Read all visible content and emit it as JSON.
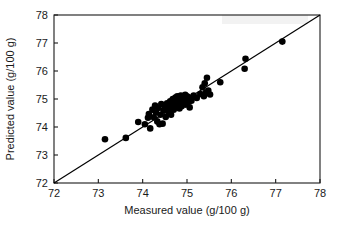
{
  "chart_data": {
    "type": "scatter",
    "title": "",
    "xlabel": "Measured value (g/100 g)",
    "ylabel": "Predicted value (g/100 g)",
    "xlim": [
      72,
      78
    ],
    "ylim": [
      72,
      78
    ],
    "xticks": [
      72,
      73,
      74,
      75,
      76,
      77,
      78
    ],
    "yticks": [
      72,
      73,
      74,
      75,
      76,
      77,
      78
    ],
    "xtick_labels": [
      "72",
      "73",
      "74",
      "75",
      "76",
      "77",
      "78"
    ],
    "ytick_labels": [
      "72",
      "73",
      "74",
      "75",
      "76",
      "77",
      "78"
    ],
    "grid": false,
    "legend": null,
    "marker_color": "#000000",
    "marker_size": 4.6,
    "reference_line": {
      "name": "identity-line",
      "type": "line",
      "from": [
        72,
        72
      ],
      "to": [
        78,
        78
      ],
      "color": "#000000"
    },
    "points": [
      [
        73.15,
        73.56
      ],
      [
        73.62,
        73.61
      ],
      [
        73.9,
        74.18
      ],
      [
        74.05,
        74.1
      ],
      [
        74.12,
        74.33
      ],
      [
        74.14,
        74.46
      ],
      [
        74.17,
        73.95
      ],
      [
        74.22,
        74.62
      ],
      [
        74.25,
        74.35
      ],
      [
        74.28,
        74.77
      ],
      [
        74.3,
        74.52
      ],
      [
        74.33,
        74.2
      ],
      [
        74.35,
        74.68
      ],
      [
        74.38,
        74.1
      ],
      [
        74.4,
        74.44
      ],
      [
        74.42,
        74.82
      ],
      [
        74.45,
        74.12
      ],
      [
        74.47,
        74.6
      ],
      [
        74.5,
        74.73
      ],
      [
        74.52,
        74.36
      ],
      [
        74.55,
        74.85
      ],
      [
        74.58,
        74.55
      ],
      [
        74.6,
        74.7
      ],
      [
        74.62,
        74.92
      ],
      [
        74.64,
        74.44
      ],
      [
        74.66,
        74.78
      ],
      [
        74.68,
        75.0
      ],
      [
        74.7,
        74.62
      ],
      [
        74.72,
        74.88
      ],
      [
        74.74,
        75.05
      ],
      [
        74.75,
        74.7
      ],
      [
        74.77,
        74.95
      ],
      [
        74.78,
        75.1
      ],
      [
        74.8,
        74.8
      ],
      [
        74.82,
        75.02
      ],
      [
        74.83,
        74.66
      ],
      [
        74.85,
        74.9
      ],
      [
        74.86,
        75.12
      ],
      [
        74.88,
        74.74
      ],
      [
        74.9,
        75.05
      ],
      [
        74.91,
        74.85
      ],
      [
        74.93,
        75.08
      ],
      [
        74.94,
        74.97
      ],
      [
        74.96,
        75.15
      ],
      [
        74.97,
        74.8
      ],
      [
        74.99,
        75.02
      ],
      [
        75.0,
        75.1
      ],
      [
        75.02,
        74.88
      ],
      [
        75.04,
        75.06
      ],
      [
        75.06,
        74.7
      ],
      [
        75.1,
        74.94
      ],
      [
        75.15,
        75.12
      ],
      [
        75.22,
        75.04
      ],
      [
        75.3,
        75.18
      ],
      [
        75.35,
        75.42
      ],
      [
        75.38,
        75.1
      ],
      [
        75.4,
        75.56
      ],
      [
        75.42,
        75.22
      ],
      [
        75.45,
        75.76
      ],
      [
        75.48,
        75.3
      ],
      [
        75.52,
        75.16
      ],
      [
        75.75,
        75.6
      ],
      [
        76.3,
        76.08
      ],
      [
        76.32,
        76.44
      ],
      [
        77.15,
        77.05
      ]
    ]
  },
  "watermark": {
    "label": "watermark"
  }
}
